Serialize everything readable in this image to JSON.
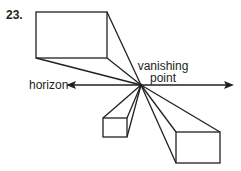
{
  "problem_number": "23.",
  "labels": {
    "vanishing_line1": "vanishing",
    "vanishing_line2": "point",
    "horizon": "horizon"
  },
  "colors": {
    "stroke": "#231f20",
    "background": "#ffffff"
  }
}
